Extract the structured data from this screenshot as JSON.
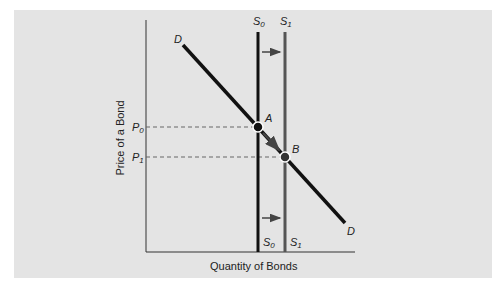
{
  "figure": {
    "x_axis_label": "Quantity of Bonds",
    "y_axis_label": "Price of a Bond",
    "price_labels": [
      {
        "id": "P0",
        "base": "P",
        "sub": "0"
      },
      {
        "id": "P1",
        "base": "P",
        "sub": "1"
      }
    ],
    "curves": {
      "demand": {
        "label": "D"
      },
      "supply_initial": {
        "base": "S",
        "sub": "0"
      },
      "supply_new": {
        "base": "S",
        "sub": "1"
      }
    },
    "points": {
      "A": "A",
      "B": "B"
    },
    "colors": {
      "background": "#e4e4e4",
      "demand": "#111111",
      "supply_initial": "#111111",
      "supply_new": "#555555",
      "dashed_guides": "#666666"
    }
  }
}
